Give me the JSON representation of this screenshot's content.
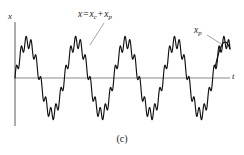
{
  "figure": {
    "caption": "(c)",
    "background_color": "#ffffff",
    "axis_color": "#8a8a8a",
    "curve_color": "#111111",
    "leader_color": "#9a9a9a"
  },
  "axes": {
    "y_label": "x",
    "x_label": "t",
    "origin_px": {
      "x": 15,
      "y": 78
    },
    "y_axis_top_px": 22,
    "y_axis_bottom_px": 126,
    "x_axis_left_px": 15,
    "x_axis_right_px": 230
  },
  "annotations": {
    "total_response": {
      "name": "x = x_c + x_p",
      "main": "x",
      "equals": "=",
      "term1_base": "x",
      "term1_sub": "c",
      "plus": "+",
      "term2_base": "x",
      "term2_sub": "p",
      "leader_from_px": {
        "x": 104,
        "y": 22
      },
      "leader_to_px": {
        "x": 90,
        "y": 44
      }
    },
    "particular_solution": {
      "name": "x_p",
      "base": "x",
      "sub": "p",
      "leader_from_px": {
        "x": 208,
        "y": 34
      },
      "leader_to_px": {
        "x": 224,
        "y": 45
      }
    }
  },
  "chart_data": {
    "type": "line",
    "title": "",
    "subtitle": "",
    "xlabel": "t",
    "ylabel": "x",
    "grid": false,
    "legend_position": "none",
    "x_range_units": [
      0,
      4.35
    ],
    "y_range_units": [
      -1.35,
      1.35
    ],
    "series": [
      {
        "name": "x = x_c + x_p",
        "style": "solid",
        "color": "#111111",
        "composition": "sum",
        "components": [
          {
            "name": "x_p",
            "waveform": "sine",
            "amplitude": 1.0,
            "cycles_over_x_range": 4.35,
            "phase_deg": 0
          },
          {
            "name": "x_c",
            "waveform": "sine",
            "amplitude": 0.17,
            "cycles_over_x_range": 43.5,
            "phase_deg": 0
          }
        ],
        "sample_count": 900
      },
      {
        "name": "x_p",
        "style": "solid-smooth",
        "color": "#111111",
        "visible_segment_x_units": [
          4.05,
          4.35
        ],
        "waveform": "sine",
        "amplitude": 1.0,
        "cycles_over_x_range": 4.35,
        "phase_deg": 0
      }
    ],
    "peaks_y_units": [
      1.0,
      1.0,
      1.0,
      1.0
    ],
    "troughs_y_units": [
      -1.0,
      -1.0,
      -1.0,
      -1.0
    ],
    "zero_crossings_x_units": [
      0.5,
      1.0,
      1.5,
      2.0,
      2.5,
      3.0,
      3.5,
      4.0
    ]
  }
}
